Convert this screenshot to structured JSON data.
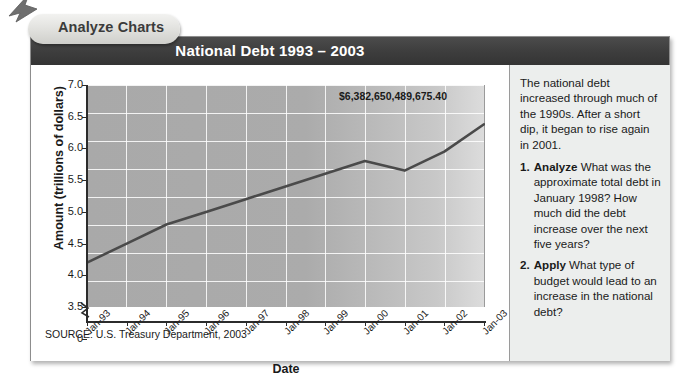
{
  "tab": {
    "label": "Analyze Charts",
    "arrow_icon": "arrow-up-left-icon"
  },
  "header": {
    "title": "National Debt 1993 – 2003"
  },
  "chart": {
    "source": "SOURCE: U.S. Treasury Department, 2003",
    "annotation": "$6,382,650,489,675.40"
  },
  "panel": {
    "intro": "The national debt increased through much of the 1990s. After a short dip, it began to rise again in 2001.",
    "questions": [
      {
        "num": "1.",
        "verb": "Analyze",
        "text": "What was the approximate total debt in January 1998? How much did the debt increase over the next five years?"
      },
      {
        "num": "2.",
        "verb": "Apply",
        "text": "What type of budget would lead to an increase in the national debt?"
      }
    ]
  },
  "chart_data": {
    "type": "line",
    "title": "National Debt 1993 – 2003",
    "xlabel": "Date",
    "ylabel": "Amount (trillions of dollars)",
    "categories": [
      "Jan-93",
      "Jan-94",
      "Jan-95",
      "Jan-96",
      "Jan-97",
      "Jan-98",
      "Jan-99",
      "Jan-00",
      "Jan-01",
      "Jan-02",
      "Jan-03"
    ],
    "values": [
      4.2,
      4.5,
      4.8,
      5.0,
      5.2,
      5.4,
      5.6,
      5.8,
      5.65,
      5.95,
      6.38
    ],
    "ytick_labels": [
      "7.0",
      "6.5",
      "6.0",
      "5.5",
      "5.0",
      "4.5",
      "4.0",
      "3.5",
      "0"
    ],
    "ytick_values": [
      7.0,
      6.5,
      6.0,
      5.5,
      5.0,
      4.5,
      4.0,
      3.5,
      0
    ],
    "ylim": [
      3.5,
      7.0
    ],
    "axis_break": true,
    "grid": true,
    "legend": "none",
    "annotations": [
      {
        "text": "$6,382,650,489,675.40",
        "at_category": "Jan-03",
        "value": 6.38
      }
    ],
    "source": "SOURCE: U.S. Treasury Department, 2003",
    "line_color": "#4a4a4a"
  },
  "colors": {
    "title_bar": "#3e3e3e",
    "plot_fill": "#ababab",
    "panel_bg": "#eceeed",
    "line": "#4a4a4a",
    "axis": "#2b2b2b"
  }
}
